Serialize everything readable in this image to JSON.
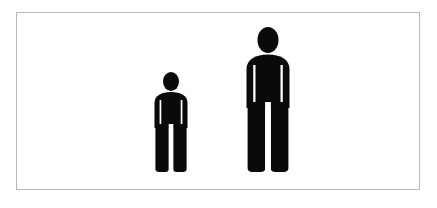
{
  "image": {
    "kind": "pictogram-illustration",
    "subject": "human figure size comparison",
    "width": 437,
    "height": 208,
    "background_color": "#ffffff"
  },
  "frame": {
    "border_color": "#b8b8b8",
    "border_width": 1,
    "fill_color": "#ffffff",
    "x": 16,
    "y": 12,
    "width": 404,
    "height": 178
  },
  "figures": [
    {
      "id": "small",
      "icon_name": "person-pictogram-small",
      "color": "#0a0a0a",
      "x": 148,
      "y": 72,
      "width": 46,
      "height": 100,
      "baseline_y": 172,
      "relative_scale": 0.69
    },
    {
      "id": "large",
      "icon_name": "person-pictogram-large",
      "color": "#0a0a0a",
      "x": 238,
      "y": 27,
      "width": 60,
      "height": 145,
      "baseline_y": 172,
      "relative_scale": 1.0
    }
  ]
}
